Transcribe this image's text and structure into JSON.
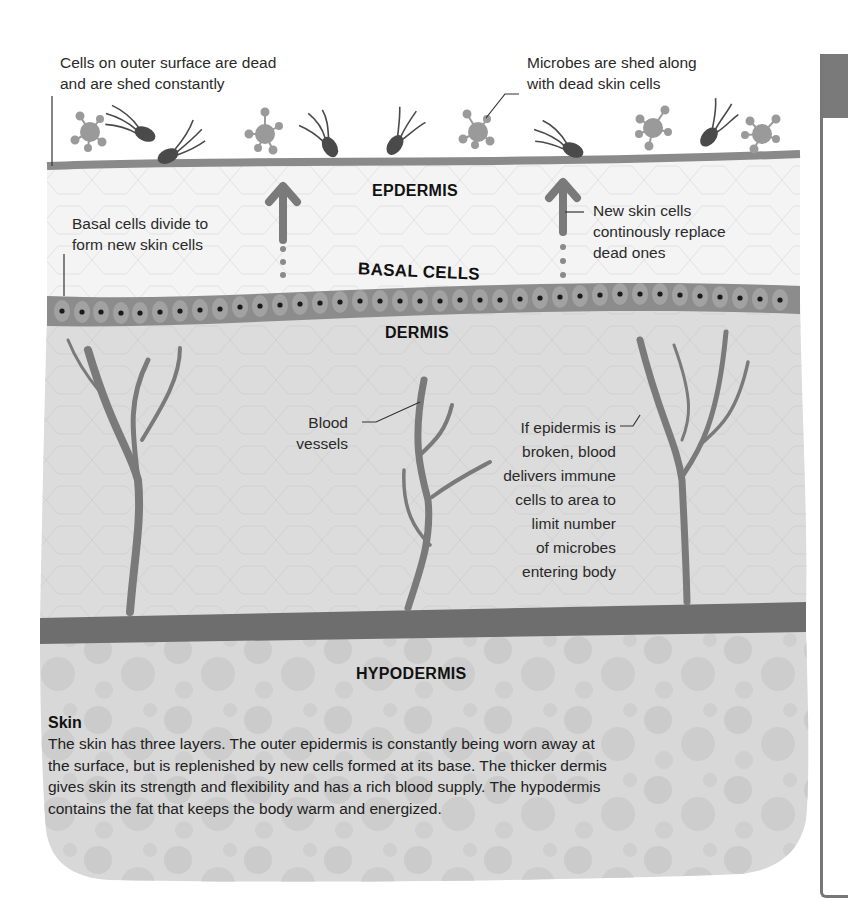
{
  "layers": {
    "epidermis": "EPDERMIS",
    "basal_cells": "BASAL CELLS",
    "dermis": "DERMIS",
    "hypodermis": "HYPODERMIS"
  },
  "annotations": {
    "dead_cells": [
      "Cells on outer surface are dead",
      "and are shed constantly"
    ],
    "microbes_shed": [
      "Microbes are shed along",
      "with dead skin cells"
    ],
    "basal_divide": [
      "Basal cells divide to",
      "form new skin cells"
    ],
    "new_cells": [
      "New skin cells",
      "continously replace",
      "dead ones"
    ],
    "blood_vessels": [
      "Blood",
      "vessels"
    ],
    "immune": [
      "If epidermis is",
      "broken, blood",
      "delivers immune",
      "cells to area to",
      "limit number",
      "of microbes",
      "entering body"
    ]
  },
  "caption": {
    "title": "Skin",
    "body": "The skin has three layers. The outer epidermis is constantly being worn away at the surface, but is replenished by new cells formed at its base. The thicker dermis gives skin its strength and flexibility and has a rich blood supply. The hypodermis contains the fat that keeps the body warm and energized."
  },
  "colors": {
    "surface_line": "#8a8a8a",
    "epidermis_fill": "#f2f2f2",
    "basal_band": "#8c8c8c",
    "dermis_fill": "#dcdcdc",
    "vessel": "#7a7a7a",
    "hypodermis_band": "#6e6e6e",
    "hypodermis_fill": "#d6d6d6",
    "microbe_virus": "#9a9a9a",
    "microbe_bacterium": "#4a4a4a"
  }
}
